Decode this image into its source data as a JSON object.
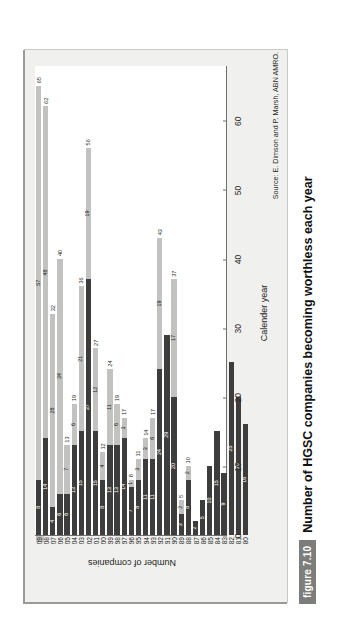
{
  "figure": {
    "badge": "figure 7.10",
    "caption": "Number of HGSC companies becoming worthless each year",
    "source": "Source: E. Dimson and P. Marsh, ABN AMRO."
  },
  "legend": {
    "items": [
      {
        "label": "HGSC plus USM/AIM stocks",
        "color": "#c2c2c0"
      },
      {
        "label": "HGSC index",
        "color": "#3d3d3d"
      }
    ]
  },
  "chart_data": {
    "type": "bar",
    "orientation": "horizontal-stacked",
    "title": "Number of HGSC companies becoming worthless each year",
    "xlabel": "Calender year",
    "ylabel": "Number of companies",
    "ylim": [
      0,
      68
    ],
    "yticks": [
      0,
      10,
      20,
      30,
      40,
      50,
      60
    ],
    "grid": false,
    "legend_position": "top-left",
    "categories": [
      "80",
      "81",
      "82",
      "83",
      "84",
      "85",
      "86",
      "87",
      "88",
      "89",
      "90",
      "91",
      "92",
      "93",
      "94",
      "95",
      "96",
      "97",
      "98",
      "99",
      "00",
      "01",
      "02",
      "03",
      "04",
      "05",
      "06",
      "07",
      "08",
      "09"
    ],
    "series": [
      {
        "name": "HGSC index",
        "color": "#3d3d3d",
        "values": [
          16,
          20,
          25,
          9,
          15,
          10,
          5,
          2,
          8,
          3,
          20,
          29,
          24,
          11,
          11,
          8,
          7,
          14,
          13,
          13,
          8,
          15,
          37,
          15,
          13,
          6,
          6,
          4,
          14,
          8
        ]
      },
      {
        "name": "HGSC plus USM/AIM stocks",
        "color": "#c2c2c0",
        "values": [
          0,
          0,
          0,
          0,
          0,
          0,
          0,
          0,
          2,
          2,
          17,
          0,
          19,
          6,
          3,
          3,
          1,
          3,
          6,
          11,
          4,
          12,
          19,
          21,
          6,
          7,
          34,
          28,
          48,
          57
        ]
      }
    ],
    "totals": [
      16,
      20,
      25,
      9,
      15,
      10,
      5,
      2,
      10,
      5,
      37,
      29,
      43,
      17,
      14,
      11,
      8,
      17,
      19,
      24,
      12,
      27,
      56,
      36,
      19,
      13,
      40,
      32,
      62,
      65
    ],
    "total_labels": [
      "",
      "",
      "",
      "",
      "",
      "",
      "",
      "",
      "10",
      "5",
      "37",
      "",
      "43",
      "17",
      "14",
      "11",
      "8",
      "17",
      "19",
      "24",
      "12",
      "27",
      "56",
      "36",
      "19",
      "13",
      "40",
      "32",
      "62",
      "65"
    ],
    "dark_labels": [
      "16",
      "20",
      "25",
      "9",
      "15",
      "10",
      "5",
      "2",
      "8",
      "3",
      "20",
      "29",
      "24",
      "11",
      "11",
      "8",
      "7",
      "14",
      "13",
      "13",
      "8",
      "15",
      "37",
      "15",
      "13",
      "6",
      "6",
      "4",
      "14",
      "8"
    ],
    "light_labels": [
      "",
      "",
      "",
      "",
      "",
      "",
      "",
      "",
      "2",
      "2",
      "17",
      "",
      "19",
      "6",
      "3",
      "3",
      "1",
      "3",
      "6",
      "11",
      "4",
      "12",
      "19",
      "21",
      "6",
      "7",
      "34",
      "28",
      "48",
      "57"
    ]
  }
}
